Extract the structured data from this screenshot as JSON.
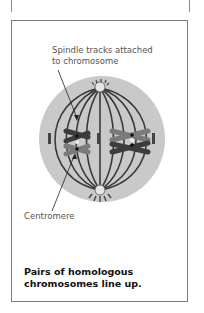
{
  "figure": {
    "labels": {
      "spindle_line1": "Spindle tracks attached",
      "spindle_line2": "to chromosome",
      "centromere": "Centromere"
    },
    "caption": {
      "line1": "Pairs of homologous",
      "line2": "chromosomes line up."
    },
    "colors": {
      "cell_fill": "#c8c8c8",
      "spindle": "#3a3a3a",
      "chromosome_dark": "#3c3c3c",
      "chromosome_light": "#7a7a7a",
      "border": "#7a7a7a"
    }
  }
}
